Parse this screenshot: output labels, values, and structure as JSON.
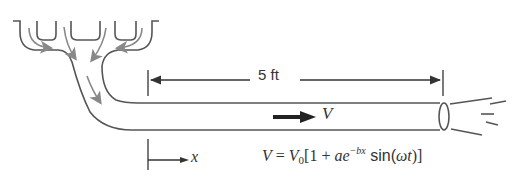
{
  "diagram": {
    "type": "pipe-flow-schematic",
    "dimension": {
      "label": "5 ft"
    },
    "flow_label": "V",
    "axis_label": "x",
    "equation": {
      "lhs": "V",
      "equals": " = ",
      "v0": "V",
      "v0_sub": "0",
      "open": "[1 + ",
      "a": "ae",
      "exponent": "−bx",
      "sin_open": " sin(",
      "omega_t": "ωt",
      "close": ")]"
    },
    "colors": {
      "line": "#555555",
      "flow_arrow": "#888888",
      "velocity_arrow": "#222222",
      "text": "#333333"
    }
  }
}
